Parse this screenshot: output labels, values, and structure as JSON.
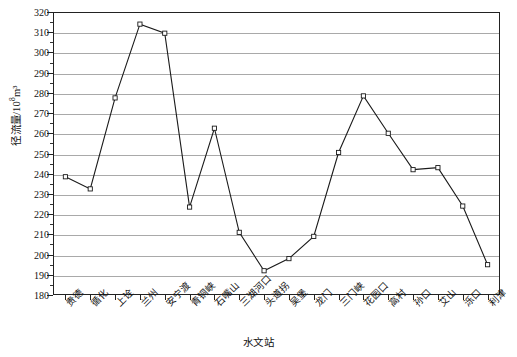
{
  "chart_data": {
    "type": "line",
    "title": "",
    "xlabel": "水文站",
    "ylabel": "径流量/10⁸m³",
    "ylabel_main": "径流量/10",
    "ylabel_exp": "8",
    "ylabel_unit": "m³",
    "ylim": [
      180,
      320
    ],
    "ytick_step": 10,
    "yticks": [
      180,
      190,
      200,
      210,
      220,
      230,
      240,
      250,
      260,
      270,
      280,
      290,
      300,
      310,
      320
    ],
    "grid": true,
    "legend": "none",
    "marker": "open-square",
    "line_color": "#1a1a1a",
    "grid_color": "#a9a9a9",
    "categories": [
      "贵德",
      "循化",
      "上诠",
      "兰州",
      "安宁渡",
      "青铜峡",
      "石嘴山",
      "三湖河口",
      "头道拐",
      "吴堡",
      "龙门",
      "三门峡",
      "花园口",
      "高村",
      "孙口",
      "艾山",
      "泺口",
      "利津"
    ],
    "values": [
      238.5,
      232.5,
      277.5,
      314.0,
      309.5,
      223.5,
      262.5,
      211.0,
      192.0,
      198.0,
      209.0,
      250.5,
      278.5,
      260.0,
      242.0,
      243.0,
      224.0,
      195.0
    ],
    "series": [
      {
        "name": "径流量",
        "values": [
          238.5,
          232.5,
          277.5,
          314.0,
          309.5,
          223.5,
          262.5,
          211.0,
          192.0,
          198.0,
          209.0,
          250.5,
          278.5,
          260.0,
          242.0,
          243.0,
          224.0,
          195.0
        ]
      }
    ]
  }
}
